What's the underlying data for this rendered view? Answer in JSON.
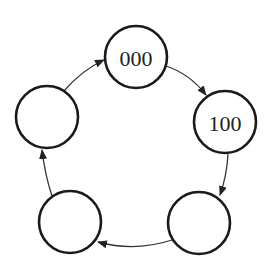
{
  "diagram": {
    "type": "state-cycle",
    "states": [
      {
        "id": "s0",
        "label": "000",
        "cx": 136,
        "cy": 57,
        "r": 31
      },
      {
        "id": "s1",
        "label": "100",
        "cx": 225,
        "cy": 122,
        "r": 31
      },
      {
        "id": "s2",
        "label": "",
        "cx": 199,
        "cy": 223,
        "r": 31
      },
      {
        "id": "s3",
        "label": "",
        "cx": 70,
        "cy": 222,
        "r": 31
      },
      {
        "id": "s4",
        "label": "",
        "cx": 47,
        "cy": 117,
        "r": 31
      }
    ],
    "transitions": [
      {
        "from": "s0",
        "to": "s1",
        "direction": "clockwise"
      },
      {
        "from": "s1",
        "to": "s2",
        "direction": "clockwise"
      },
      {
        "from": "s2",
        "to": "s3",
        "direction": "clockwise"
      },
      {
        "from": "s3",
        "to": "s4",
        "direction": "clockwise"
      },
      {
        "from": "s4",
        "to": "s0",
        "direction": "clockwise"
      }
    ],
    "colors": {
      "stroke": "#1a1a1a",
      "arrow": "#333333",
      "background": "#ffffff"
    }
  }
}
